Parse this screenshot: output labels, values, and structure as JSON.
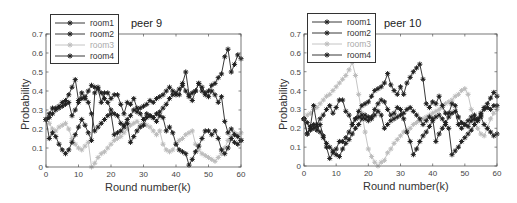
{
  "chart_data": [
    {
      "type": "line",
      "title": "peer 9",
      "xlabel": "Round number(k)",
      "ylabel": "Probability",
      "xlim": [
        0,
        60
      ],
      "ylim": [
        0,
        0.7
      ],
      "xticks": [
        0,
        10,
        20,
        30,
        40,
        50,
        60
      ],
      "yticks": [
        0,
        0.1,
        0.2,
        0.3,
        0.4,
        0.5,
        0.6,
        0.7
      ],
      "grid": false,
      "legend_position": "upper-left",
      "legend": [
        "room1",
        "room2",
        "room3",
        "room4"
      ],
      "x": [
        0,
        1,
        2,
        3,
        4,
        5,
        6,
        7,
        8,
        9,
        10,
        11,
        12,
        13,
        14,
        15,
        16,
        17,
        18,
        19,
        20,
        21,
        22,
        23,
        24,
        25,
        26,
        27,
        28,
        29,
        30,
        31,
        32,
        33,
        34,
        35,
        36,
        37,
        38,
        39,
        40,
        41,
        42,
        43,
        44,
        45,
        46,
        47,
        48,
        49,
        50,
        51,
        52,
        53,
        54,
        55,
        56,
        57,
        58,
        59,
        60
      ],
      "series": [
        {
          "name": "room1",
          "color": "#222222",
          "values": [
            0.25,
            0.28,
            0.31,
            0.31,
            0.32,
            0.34,
            0.35,
            0.38,
            0.42,
            0.46,
            0.35,
            0.39,
            0.36,
            0.4,
            0.43,
            0.42,
            0.41,
            0.34,
            0.39,
            0.39,
            0.36,
            0.38,
            0.38,
            0.33,
            0.28,
            0.34,
            0.33,
            0.36,
            0.31,
            0.28,
            0.25,
            0.28,
            0.27,
            0.26,
            0.24,
            0.27,
            0.26,
            0.19,
            0.21,
            0.18,
            0.12,
            0.09,
            0.08,
            0.07,
            0.01,
            0.04,
            0.08,
            0.11,
            0.15,
            0.19,
            0.19,
            0.17,
            0.19,
            0.15,
            0.09,
            0.07,
            0.1,
            0.15,
            0.13,
            0.12,
            0.14
          ]
        },
        {
          "name": "room2",
          "color": "#222222",
          "values": [
            0.25,
            0.15,
            0.18,
            0.16,
            0.12,
            0.09,
            0.07,
            0.09,
            0.13,
            0.17,
            0.21,
            0.25,
            0.22,
            0.18,
            0.14,
            0.39,
            0.42,
            0.39,
            0.36,
            0.34,
            0.3,
            0.28,
            0.27,
            0.23,
            0.22,
            0.25,
            0.27,
            0.3,
            0.29,
            0.31,
            0.32,
            0.33,
            0.35,
            0.34,
            0.36,
            0.37,
            0.38,
            0.4,
            0.42,
            0.4,
            0.38,
            0.38,
            0.44,
            0.5,
            0.38,
            0.35,
            0.4,
            0.44,
            0.4,
            0.38,
            0.4,
            0.43,
            0.44,
            0.47,
            0.49,
            0.58,
            0.62,
            0.5,
            0.54,
            0.59,
            0.57
          ]
        },
        {
          "name": "room3",
          "color": "#bdbdbd",
          "values": [
            0.25,
            0.23,
            0.2,
            0.19,
            0.21,
            0.22,
            0.23,
            0.2,
            0.15,
            0.12,
            0.1,
            0.09,
            0.11,
            0.13,
            0.0,
            0.02,
            0.05,
            0.07,
            0.08,
            0.1,
            0.12,
            0.14,
            0.15,
            0.16,
            0.18,
            0.2,
            0.22,
            0.23,
            0.24,
            0.22,
            0.23,
            0.22,
            0.21,
            0.19,
            0.17,
            0.19,
            0.12,
            0.09,
            0.08,
            0.09,
            0.12,
            0.14,
            0.15,
            0.17,
            0.18,
            0.19,
            0.12,
            0.09,
            0.07,
            0.06,
            0.05,
            0.04,
            0.03,
            0.05,
            0.07,
            0.1,
            0.14,
            0.16,
            0.18,
            0.17,
            0.18
          ]
        },
        {
          "name": "room4",
          "color": "#222222",
          "values": [
            0.25,
            0.26,
            0.28,
            0.3,
            0.31,
            0.32,
            0.33,
            0.34,
            0.27,
            0.3,
            0.34,
            0.36,
            0.37,
            0.34,
            0.28,
            0.19,
            0.21,
            0.23,
            0.25,
            0.27,
            0.28,
            0.17,
            0.18,
            0.19,
            0.21,
            0.23,
            0.13,
            0.16,
            0.19,
            0.21,
            0.22,
            0.26,
            0.27,
            0.26,
            0.28,
            0.29,
            0.31,
            0.33,
            0.36,
            0.38,
            0.39,
            0.41,
            0.43,
            0.4,
            0.37,
            0.39,
            0.4,
            0.44,
            0.42,
            0.39,
            0.37,
            0.4,
            0.38,
            0.34,
            0.37,
            0.24,
            0.18,
            0.2,
            0.17,
            0.16,
            0.14
          ]
        }
      ]
    },
    {
      "type": "line",
      "title": "peer 10",
      "xlabel": "Round number(k)",
      "ylabel": "Probability",
      "xlim": [
        0,
        60
      ],
      "ylim": [
        0,
        0.7
      ],
      "xticks": [
        0,
        10,
        20,
        30,
        40,
        50,
        60
      ],
      "yticks": [
        0,
        0.1,
        0.2,
        0.3,
        0.4,
        0.5,
        0.6,
        0.7
      ],
      "grid": false,
      "legend_position": "upper-left",
      "legend": [
        "room1",
        "room2",
        "room3",
        "room4"
      ],
      "x": [
        0,
        1,
        2,
        3,
        4,
        5,
        6,
        7,
        8,
        9,
        10,
        11,
        12,
        13,
        14,
        15,
        16,
        17,
        18,
        19,
        20,
        21,
        22,
        23,
        24,
        25,
        26,
        27,
        28,
        29,
        30,
        31,
        32,
        33,
        34,
        35,
        36,
        37,
        38,
        39,
        40,
        41,
        42,
        43,
        44,
        45,
        46,
        47,
        48,
        49,
        50,
        51,
        52,
        53,
        54,
        55,
        56,
        57,
        58,
        59,
        60
      ],
      "series": [
        {
          "name": "room1",
          "color": "#222222",
          "values": [
            0.25,
            0.17,
            0.2,
            0.22,
            0.19,
            0.22,
            0.16,
            0.1,
            0.04,
            0.07,
            0.09,
            0.13,
            0.13,
            0.15,
            0.18,
            0.22,
            0.25,
            0.26,
            0.27,
            0.25,
            0.24,
            0.26,
            0.3,
            0.33,
            0.35,
            0.34,
            0.3,
            0.27,
            0.28,
            0.31,
            0.3,
            0.25,
            0.18,
            0.13,
            0.06,
            0.09,
            0.13,
            0.16,
            0.18,
            0.21,
            0.24,
            0.26,
            0.27,
            0.25,
            0.22,
            0.2,
            0.06,
            0.08,
            0.1,
            0.13,
            0.15,
            0.17,
            0.19,
            0.22,
            0.24,
            0.26,
            0.22,
            0.2,
            0.18,
            0.16,
            0.17
          ]
        },
        {
          "name": "room2",
          "color": "#222222",
          "values": [
            0.25,
            0.17,
            0.21,
            0.32,
            0.22,
            0.25,
            0.27,
            0.3,
            0.32,
            0.28,
            0.31,
            0.35,
            0.35,
            0.29,
            0.27,
            0.22,
            0.25,
            0.29,
            0.32,
            0.33,
            0.34,
            0.37,
            0.4,
            0.41,
            0.42,
            0.44,
            0.49,
            0.43,
            0.4,
            0.38,
            0.42,
            0.38,
            0.44,
            0.47,
            0.5,
            0.52,
            0.54,
            0.46,
            0.33,
            0.31,
            0.34,
            0.33,
            0.37,
            0.32,
            0.28,
            0.28,
            0.33,
            0.32,
            0.26,
            0.23,
            0.22,
            0.21,
            0.24,
            0.25,
            0.24,
            0.27,
            0.31,
            0.33,
            0.36,
            0.39,
            0.37
          ]
        },
        {
          "name": "room3",
          "color": "#bdbdbd",
          "values": [
            0.25,
            0.27,
            0.28,
            0.3,
            0.31,
            0.33,
            0.35,
            0.37,
            0.38,
            0.4,
            0.42,
            0.44,
            0.46,
            0.48,
            0.51,
            0.55,
            0.48,
            0.38,
            0.28,
            0.18,
            0.09,
            0.05,
            0.02,
            0.0,
            0.02,
            0.03,
            0.07,
            0.09,
            0.12,
            0.14,
            0.16,
            0.18,
            0.19,
            0.2,
            0.22,
            0.23,
            0.24,
            0.25,
            0.26,
            0.27,
            0.28,
            0.29,
            0.3,
            0.31,
            0.33,
            0.34,
            0.35,
            0.37,
            0.38,
            0.4,
            0.41,
            0.38,
            0.3,
            0.24,
            0.2,
            0.17,
            0.16,
            0.2,
            0.25,
            0.28,
            0.3
          ]
        },
        {
          "name": "room4",
          "color": "#222222",
          "values": [
            0.25,
            0.23,
            0.19,
            0.2,
            0.21,
            0.18,
            0.15,
            0.12,
            0.1,
            0.08,
            0.06,
            0.05,
            0.09,
            0.12,
            0.14,
            0.17,
            0.2,
            0.22,
            0.25,
            0.27,
            0.26,
            0.25,
            0.27,
            0.29,
            0.27,
            0.2,
            0.22,
            0.24,
            0.25,
            0.26,
            0.27,
            0.28,
            0.3,
            0.31,
            0.29,
            0.27,
            0.25,
            0.22,
            0.24,
            0.26,
            0.25,
            0.13,
            0.17,
            0.2,
            0.23,
            0.26,
            0.28,
            0.29,
            0.22,
            0.2,
            0.22,
            0.24,
            0.26,
            0.27,
            0.25,
            0.28,
            0.3,
            0.31,
            0.3,
            0.32,
            0.32
          ]
        }
      ]
    }
  ],
  "charts": [
    {
      "title": "peer 9",
      "xlabel": "Round number(k)",
      "ylabel": "Probability",
      "xtick_labels": [
        "0",
        "10",
        "20",
        "30",
        "40",
        "50",
        "60"
      ],
      "ytick_labels": [
        "0",
        "0.1",
        "0.2",
        "0.3",
        "0.4",
        "0.5",
        "0.6",
        "0.7"
      ],
      "legend": [
        "room1",
        "room2",
        "room3",
        "room4"
      ]
    },
    {
      "title": "peer 10",
      "xlabel": "Round number(k)",
      "ylabel": "Probability",
      "xtick_labels": [
        "0",
        "10",
        "20",
        "30",
        "40",
        "50",
        "60"
      ],
      "ytick_labels": [
        "0",
        "0.1",
        "0.2",
        "0.3",
        "0.4",
        "0.5",
        "0.6",
        "0.7"
      ],
      "legend": [
        "room1",
        "room2",
        "room3",
        "room4"
      ]
    }
  ]
}
